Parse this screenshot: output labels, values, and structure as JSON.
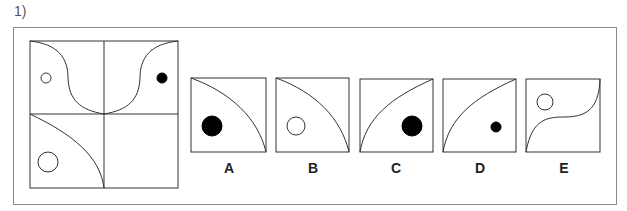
{
  "question": {
    "number": "1)"
  },
  "options": [
    {
      "label": "A"
    },
    {
      "label": "B"
    },
    {
      "label": "C"
    },
    {
      "label": "D"
    },
    {
      "label": "E"
    }
  ],
  "colors": {
    "line": "#333333",
    "fill": "#000000",
    "frame": "#8a8a8a"
  }
}
